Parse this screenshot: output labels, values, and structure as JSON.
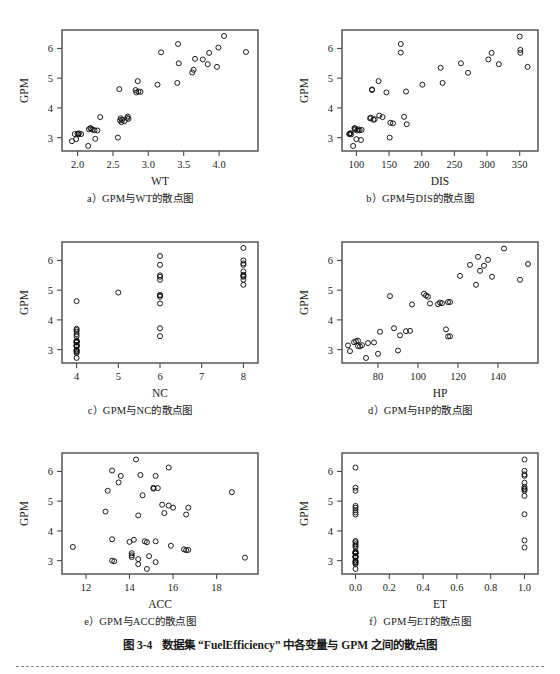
{
  "figure": {
    "number": "图 3-4",
    "caption": "数据集 “FuelEfficiency” 中各变量与 GPM 之间的散点图",
    "y_axis_label": "GPM"
  },
  "panels": [
    {
      "id": "a",
      "caption": "a）GPM与WT的散点图",
      "xlabel": "WT",
      "ylabel": "GPM",
      "xticks": [
        "2.0",
        "2.5",
        "3.0",
        "3.5",
        "4.0"
      ],
      "yticks": [
        "3",
        "4",
        "5",
        "6"
      ]
    },
    {
      "id": "b",
      "caption": "b）GPM与DIS的散点图",
      "xlabel": "DIS",
      "ylabel": "GPM",
      "xticks": [
        "100",
        "150",
        "200",
        "250",
        "300",
        "350"
      ],
      "yticks": [
        "3",
        "4",
        "5",
        "6"
      ]
    },
    {
      "id": "c",
      "caption": "c）GPM与NC的散点图",
      "xlabel": "NC",
      "ylabel": "GPM",
      "xticks": [
        "4",
        "5",
        "6",
        "7",
        "8"
      ],
      "yticks": [
        "3",
        "4",
        "5",
        "6"
      ]
    },
    {
      "id": "d",
      "caption": "d）GPM与HP的散点图",
      "xlabel": "HP",
      "ylabel": "GPM",
      "xticks": [
        "80",
        "100",
        "120",
        "140"
      ],
      "yticks": [
        "3",
        "4",
        "5",
        "6"
      ]
    },
    {
      "id": "e",
      "caption": "e）GPM与ACC的散点图",
      "xlabel": "ACC",
      "ylabel": "GPM",
      "xticks": [
        "12",
        "14",
        "16",
        "18"
      ],
      "yticks": [
        "3",
        "4",
        "5",
        "6"
      ]
    },
    {
      "id": "f",
      "caption": "f）GPM与ET的散点图",
      "xlabel": "ET",
      "ylabel": "GPM",
      "xticks": [
        "0.0",
        "0.2",
        "0.4",
        "0.6",
        "0.8",
        "1.0"
      ],
      "yticks": [
        "3",
        "4",
        "5",
        "6"
      ]
    }
  ],
  "chart_data": [
    {
      "type": "scatter",
      "panel": "a",
      "title": "a）GPM与WT的散点图",
      "xlabel": "WT",
      "ylabel": "GPM",
      "xlim": [
        1.78,
        4.55
      ],
      "ylim": [
        2.55,
        6.62
      ],
      "xticks": [
        2.0,
        2.5,
        3.0,
        3.5,
        4.0
      ],
      "yticks": [
        3,
        4,
        5,
        6
      ],
      "grid": false,
      "legend": null,
      "x": [
        1.92,
        1.96,
        1.98,
        2.0,
        2.01,
        2.02,
        2.05,
        2.15,
        2.16,
        2.18,
        2.19,
        2.21,
        2.24,
        2.25,
        2.28,
        2.32,
        2.57,
        2.59,
        2.6,
        2.61,
        2.62,
        2.63,
        2.66,
        2.7,
        2.71,
        2.72,
        2.82,
        2.83,
        2.85,
        2.86,
        2.89,
        3.13,
        3.18,
        3.41,
        3.42,
        3.43,
        3.62,
        3.64,
        3.66,
        3.77,
        3.84,
        3.86,
        3.97,
        3.99,
        4.07,
        4.38
      ],
      "y": [
        2.88,
        3.12,
        2.95,
        3.13,
        3.11,
        3.14,
        3.12,
        2.72,
        3.28,
        3.32,
        3.31,
        3.27,
        3.25,
        2.96,
        3.24,
        3.69,
        3.0,
        4.63,
        3.58,
        3.65,
        3.52,
        3.6,
        3.55,
        3.66,
        3.71,
        3.63,
        4.6,
        4.52,
        4.9,
        4.55,
        4.54,
        4.78,
        5.87,
        4.84,
        6.15,
        5.5,
        5.19,
        5.28,
        5.65,
        5.63,
        5.47,
        5.85,
        5.38,
        6.03,
        6.42,
        5.88
      ]
    },
    {
      "type": "scatter",
      "panel": "b",
      "title": "b）GPM与DIS的散点图",
      "xlabel": "DIS",
      "ylabel": "GPM",
      "xlim": [
        78,
        378
      ],
      "ylim": [
        2.55,
        6.62
      ],
      "xticks": [
        100,
        150,
        200,
        250,
        300,
        350
      ],
      "yticks": [
        3,
        4,
        5,
        6
      ],
      "grid": false,
      "legend": null,
      "x": [
        89,
        90,
        91,
        92,
        95,
        97,
        98,
        98,
        100,
        101,
        103,
        105,
        107,
        108,
        121,
        122,
        124,
        124,
        126,
        128,
        134,
        135,
        140,
        146,
        151,
        152,
        156,
        168,
        168,
        173,
        176,
        177,
        201,
        229,
        232,
        260,
        271,
        302,
        307,
        318,
        350,
        351,
        351,
        362
      ],
      "y": [
        3.12,
        3.13,
        3.15,
        3.11,
        2.72,
        3.32,
        3.31,
        3.27,
        2.95,
        3.24,
        3.28,
        3.25,
        2.92,
        3.26,
        3.65,
        3.67,
        4.62,
        4.6,
        3.6,
        3.62,
        4.9,
        3.74,
        3.69,
        4.52,
        3.0,
        3.5,
        3.48,
        6.15,
        5.86,
        3.7,
        4.55,
        3.45,
        4.78,
        5.35,
        4.84,
        5.5,
        5.18,
        5.63,
        5.85,
        5.47,
        6.4,
        5.95,
        5.85,
        5.38
      ]
    },
    {
      "type": "scatter",
      "panel": "c",
      "title": "c）GPM与NC的散点图",
      "xlabel": "NC",
      "ylabel": "GPM",
      "xlim": [
        3.65,
        8.35
      ],
      "ylim": [
        2.55,
        6.62
      ],
      "xticks": [
        4,
        5,
        6,
        7,
        8
      ],
      "yticks": [
        3,
        4,
        5,
        6
      ],
      "grid": false,
      "legend": null,
      "x": [
        4,
        4,
        4,
        4,
        4,
        4,
        4,
        4,
        4,
        4,
        4,
        4,
        4,
        4,
        4,
        4,
        4,
        4,
        4,
        4,
        4,
        4,
        4,
        5,
        6,
        6,
        6,
        6,
        6,
        6,
        6,
        6,
        6,
        6,
        6,
        8,
        8,
        8,
        8,
        8,
        8,
        8,
        8,
        8,
        8
      ],
      "y": [
        2.72,
        2.88,
        2.92,
        2.95,
        2.96,
        3.0,
        3.1,
        3.12,
        3.13,
        3.14,
        3.15,
        3.24,
        3.25,
        3.26,
        3.27,
        3.28,
        3.31,
        3.45,
        3.52,
        3.6,
        3.66,
        3.7,
        4.63,
        4.92,
        3.45,
        3.72,
        4.55,
        4.78,
        4.82,
        4.84,
        5.35,
        5.45,
        5.5,
        5.85,
        6.15,
        5.18,
        5.35,
        5.45,
        5.48,
        5.52,
        5.63,
        5.85,
        5.9,
        6.0,
        6.42
      ]
    },
    {
      "type": "scatter",
      "panel": "d",
      "title": "d）GPM与HP的散点图",
      "xlabel": "HP",
      "ylabel": "GPM",
      "xlim": [
        62,
        160
      ],
      "ylim": [
        2.55,
        6.62
      ],
      "xticks": [
        80,
        100,
        120,
        140
      ],
      "yticks": [
        3,
        4,
        5,
        6
      ],
      "grid": false,
      "legend": null,
      "x": [
        65,
        66,
        68,
        69,
        70,
        70,
        71,
        72,
        74,
        75,
        78,
        80,
        81,
        86,
        88,
        90,
        91,
        94,
        96,
        97,
        103,
        104,
        105,
        106,
        110,
        111,
        112,
        114,
        115,
        115,
        116,
        116,
        121,
        126,
        129,
        130,
        131,
        133,
        135,
        137,
        143,
        151,
        155
      ],
      "y": [
        3.14,
        2.95,
        3.25,
        3.28,
        3.3,
        3.12,
        3.11,
        3.15,
        2.72,
        3.22,
        3.24,
        2.86,
        3.6,
        4.8,
        3.72,
        2.97,
        3.48,
        3.62,
        3.63,
        4.52,
        4.88,
        4.82,
        4.78,
        4.55,
        4.53,
        4.58,
        4.56,
        3.68,
        4.6,
        3.44,
        4.6,
        3.45,
        5.48,
        5.85,
        5.18,
        6.12,
        5.65,
        5.82,
        6.02,
        5.45,
        6.4,
        5.35,
        5.88
      ]
    },
    {
      "type": "scatter",
      "panel": "e",
      "title": "e）GPM与ACC的散点图",
      "xlabel": "ACC",
      "ylabel": "GPM",
      "xlim": [
        10.9,
        19.9
      ],
      "ylim": [
        2.55,
        6.62
      ],
      "xticks": [
        12,
        14,
        16,
        18
      ],
      "yticks": [
        3,
        4,
        5,
        6
      ],
      "grid": false,
      "legend": null,
      "x": [
        11.4,
        12.9,
        13.0,
        13.2,
        13.2,
        13.2,
        13.3,
        13.5,
        13.6,
        14.0,
        14.1,
        14.1,
        14.1,
        14.2,
        14.3,
        14.4,
        14.4,
        14.4,
        14.5,
        14.6,
        14.7,
        14.8,
        14.8,
        14.9,
        15.1,
        15.1,
        15.2,
        15.2,
        15.2,
        15.3,
        15.5,
        15.6,
        15.8,
        15.8,
        15.9,
        16.0,
        16.5,
        16.6,
        16.6,
        16.7,
        16.7,
        18.7,
        19.3
      ],
      "y": [
        3.46,
        4.65,
        5.35,
        6.03,
        3.72,
        3.0,
        2.98,
        5.63,
        5.85,
        3.63,
        3.25,
        3.18,
        3.12,
        3.7,
        6.4,
        4.52,
        3.05,
        2.88,
        5.88,
        5.2,
        3.65,
        3.62,
        2.72,
        3.15,
        5.45,
        5.42,
        5.85,
        3.65,
        2.95,
        5.44,
        4.88,
        4.6,
        6.13,
        4.85,
        3.5,
        4.78,
        3.38,
        4.55,
        3.35,
        4.78,
        3.36,
        5.3,
        3.1
      ]
    },
    {
      "type": "scatter",
      "panel": "f",
      "title": "f）GPM与ET的散点图",
      "xlabel": "ET",
      "ylabel": "GPM",
      "xlim": [
        -0.08,
        1.08
      ],
      "ylim": [
        2.55,
        6.62
      ],
      "xticks": [
        0.0,
        0.2,
        0.4,
        0.6,
        0.8,
        1.0
      ],
      "yticks": [
        3,
        4,
        5,
        6
      ],
      "grid": false,
      "legend": null,
      "x": [
        0,
        0,
        0,
        0,
        0,
        0,
        0,
        0,
        0,
        0,
        0,
        0,
        0,
        0,
        0,
        0,
        0,
        0,
        0,
        0,
        0,
        0,
        0,
        0,
        0,
        0,
        0,
        0,
        0,
        0,
        1,
        1,
        1,
        1,
        1,
        1,
        1,
        1,
        1,
        1,
        1,
        1,
        1
      ],
      "y": [
        2.72,
        2.88,
        2.92,
        2.95,
        2.96,
        3.0,
        3.1,
        3.12,
        3.13,
        3.14,
        3.15,
        3.24,
        3.25,
        3.26,
        3.27,
        3.28,
        3.31,
        3.45,
        3.5,
        3.55,
        3.62,
        3.66,
        4.55,
        4.62,
        4.7,
        4.78,
        4.84,
        5.35,
        5.45,
        6.13,
        3.44,
        3.68,
        4.56,
        5.18,
        5.35,
        5.4,
        5.42,
        5.48,
        5.62,
        5.85,
        5.9,
        6.02,
        6.4
      ]
    }
  ]
}
